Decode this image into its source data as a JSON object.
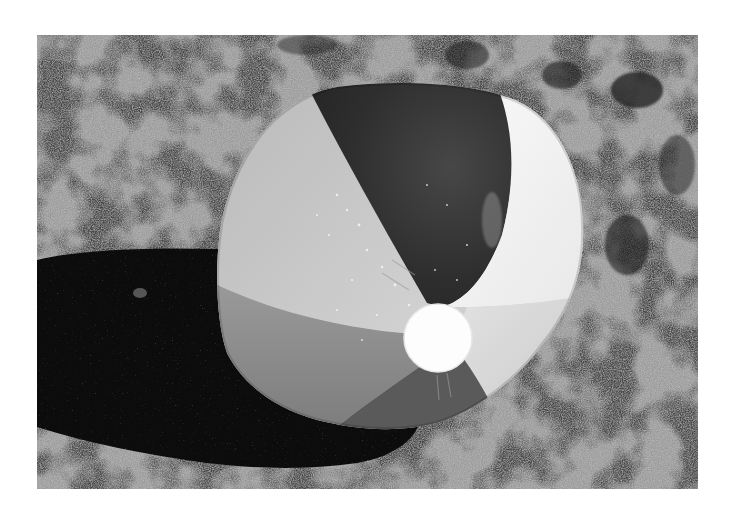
{
  "image": {
    "subject": "Inflatable beach ball resting on sand",
    "description": "Grayscale photograph of a striped beach ball with water droplets sitting on coarse sand, casting a long dark shadow to the left",
    "mode": "grayscale",
    "colors": {
      "page_background": "#ffffff",
      "sand_light": "#b4b4b4",
      "sand_dark": "#3a3a3a",
      "shadow": "#0c0c0c",
      "panel_dark": "#2e2e2e",
      "panel_light_gray": "#c6c6c6",
      "panel_white": "#f6f6f6",
      "panel_mid_gray": "#8e8e8e",
      "panel_bottom_dark": "#4a4a4a",
      "cap": "#fdfdfd"
    },
    "elements": [
      {
        "name": "sand",
        "label": "Sand ground"
      },
      {
        "name": "shadow",
        "label": "Ball shadow"
      },
      {
        "name": "beach-ball",
        "label": "Beach ball"
      },
      {
        "name": "ball-cap",
        "label": "Valve cap"
      }
    ]
  }
}
